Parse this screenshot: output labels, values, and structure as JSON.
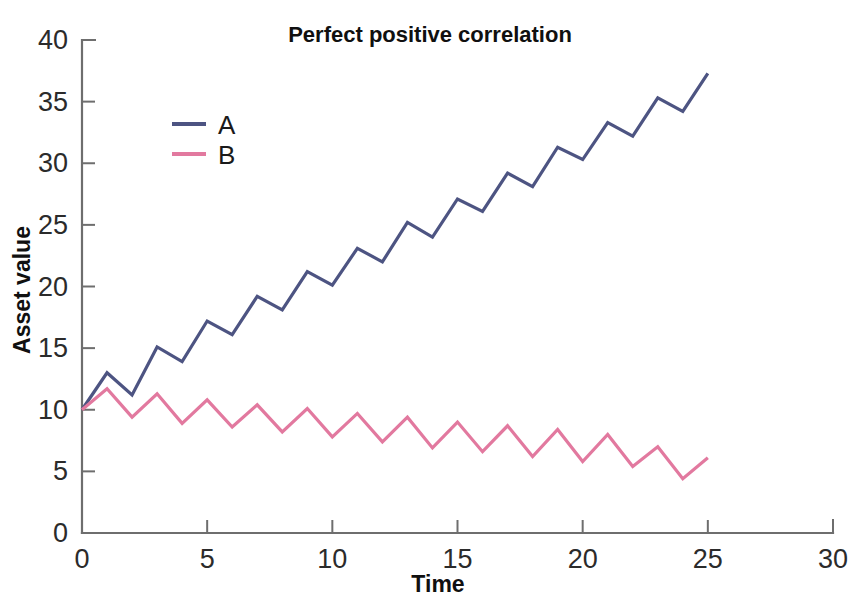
{
  "chart_data": {
    "type": "line",
    "title": "Perfect positive correlation",
    "xlabel": "Time",
    "ylabel": "Asset value",
    "xlim": [
      0,
      30
    ],
    "ylim": [
      0,
      40
    ],
    "xticks": [
      "0",
      "5",
      "10",
      "15",
      "20",
      "25",
      "30"
    ],
    "xtick_values": [
      0,
      5,
      10,
      15,
      20,
      25,
      30
    ],
    "yticks": [
      "0",
      "5",
      "10",
      "15",
      "20",
      "25",
      "30",
      "35",
      "40"
    ],
    "ytick_values": [
      0,
      5,
      10,
      15,
      20,
      25,
      30,
      35,
      40
    ],
    "grid": false,
    "legend_position": "upper-left-inside",
    "x": [
      0,
      1,
      2,
      3,
      4,
      5,
      6,
      7,
      8,
      9,
      10,
      11,
      12,
      13,
      14,
      15,
      16,
      17,
      18,
      19,
      20,
      21,
      22,
      23,
      24,
      25
    ],
    "series": [
      {
        "name": "A",
        "color": "#4d5482",
        "values": [
          10.0,
          13.0,
          11.2,
          15.1,
          13.9,
          17.2,
          16.1,
          19.2,
          18.1,
          21.2,
          20.1,
          23.1,
          22.0,
          25.2,
          24.0,
          27.1,
          26.1,
          29.2,
          28.1,
          31.3,
          30.3,
          33.3,
          32.2,
          35.3,
          34.2,
          37.3
        ]
      },
      {
        "name": "B",
        "color": "#e2799f",
        "values": [
          10.0,
          11.7,
          9.4,
          11.3,
          8.9,
          10.8,
          8.6,
          10.4,
          8.2,
          10.1,
          7.8,
          9.7,
          7.4,
          9.4,
          6.9,
          9.0,
          6.6,
          8.7,
          6.2,
          8.4,
          5.8,
          8.0,
          5.4,
          7.0,
          4.4,
          6.1
        ]
      }
    ]
  },
  "legend": {
    "entries": [
      {
        "label": "A",
        "color": "#4d5482"
      },
      {
        "label": "B",
        "color": "#e2799f"
      }
    ]
  },
  "axis_color": "#6e6e6e",
  "background": "#ffffff"
}
